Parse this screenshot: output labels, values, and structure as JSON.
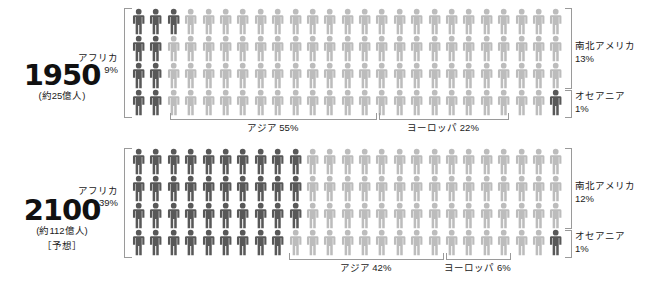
{
  "chart_data": {
    "type": "pie",
    "unit": "%",
    "note": "100体の人型ピクトグラム = 100% (1体 = 1%)",
    "panels": [
      {
        "year": "1950",
        "population": "(約25億人)",
        "note": "",
        "categories": [
          "アフリカ",
          "アジア",
          "ヨーロッパ",
          "南北アメリカ",
          "オセアニア"
        ],
        "values": [
          9,
          55,
          22,
          13,
          1
        ],
        "labels": {
          "africa": "アフリカ",
          "africa_pct": "9%",
          "asia": "アジア 55%",
          "europe": "ヨーロッパ 22%",
          "americas": "南北アメリカ",
          "americas_pct": "13%",
          "oceania": "オセアニア",
          "oceania_pct": "1%"
        }
      },
      {
        "year": "2100",
        "population": "(約112億人)",
        "note": "［予想］",
        "categories": [
          "アフリカ",
          "アジア",
          "ヨーロッパ",
          "南北アメリカ",
          "オセアニア"
        ],
        "values": [
          39,
          42,
          6,
          12,
          1
        ],
        "labels": {
          "africa": "アフリカ",
          "africa_pct": "39%",
          "asia": "アジア 42%",
          "europe": "ヨーロッパ 6%",
          "americas": "南北アメリカ",
          "americas_pct": "12%",
          "oceania": "オセアニア",
          "oceania_pct": "1%"
        }
      }
    ],
    "colors": {
      "dark_figure": "#585858",
      "light_figure": "#bcbcbc",
      "bracket": "#9a9a9a",
      "text": "#1a1a1a",
      "background": "#ffffff"
    },
    "grid": {
      "columns": 25,
      "rows": 4,
      "total": 100
    }
  }
}
